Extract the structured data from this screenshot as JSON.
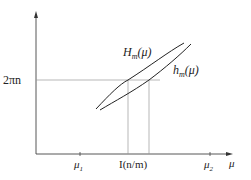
{
  "diagram": {
    "y_level_label": "2πn",
    "x_axis_symbol": "μ",
    "ticks": [
      {
        "name": "mu1",
        "base": "μ",
        "sub": "1"
      },
      {
        "name": "I",
        "text": "I(n/m)"
      },
      {
        "name": "mu2",
        "base": "μ",
        "sub": "2"
      }
    ],
    "curves": [
      {
        "name": "H_m(mu)",
        "base": "H",
        "sub": "m",
        "arg": "(μ)"
      },
      {
        "name": "h_m(mu)",
        "base": "h",
        "sub": "m",
        "arg": "(μ)"
      }
    ],
    "colors": {
      "axis": "#333333",
      "curve": "#222222",
      "guide": "#999999"
    }
  }
}
